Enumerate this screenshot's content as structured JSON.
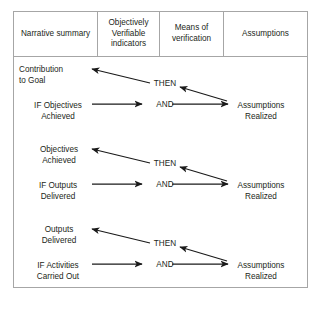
{
  "diagram": {
    "type": "logframe-vertical-logic",
    "background_color": "#ffffff",
    "line_color": "#1a1a1a",
    "border_color": "#a6a6a6",
    "text_color": "#231f20"
  },
  "table": {
    "columns": [
      {
        "id": "narrative",
        "label": "Narrative\nsummary"
      },
      {
        "id": "indicators",
        "label": "Objectively\nVerifiable\nindicators"
      },
      {
        "id": "verification",
        "label": "Means of\nverification"
      },
      {
        "id": "assumptions",
        "label": "Assumptions"
      }
    ]
  },
  "blocks": [
    {
      "id": "goal-level",
      "result": "Contribution\nto Goal",
      "condition": "IF Objectives\nAchieved",
      "assumption": "Assumptions\nRealized",
      "operator_then": "THEN",
      "operator_and": "AND"
    },
    {
      "id": "objective-level",
      "result": "Objectives\nAchieved",
      "condition": "IF Outputs\nDelivered",
      "assumption": "Assumptions\nRealized",
      "operator_then": "THEN",
      "operator_and": "AND"
    },
    {
      "id": "output-level",
      "result": "Outputs\nDelivered",
      "condition": "IF Activities\nCarried Out",
      "assumption": "Assumptions\nRealized",
      "operator_then": "THEN",
      "operator_and": "AND"
    }
  ]
}
